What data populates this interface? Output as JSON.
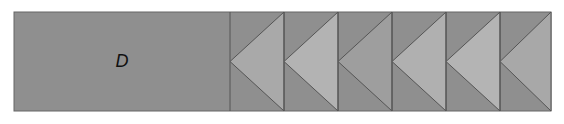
{
  "diagram": {
    "label": "D",
    "colors": {
      "background": "#ffffff",
      "block_fill": "#8f8f8f",
      "triangle_fills": [
        "#a9a9a9",
        "#b3b3b3",
        "#9e9e9e",
        "#b0b0b0",
        "#b4b4b4",
        "#a8a8a8"
      ],
      "outline": "#555555"
    },
    "sections": [
      {
        "name": "label-block",
        "x0": 14,
        "x1": 230
      },
      {
        "name": "triangle-1",
        "x0": 230,
        "x1": 284
      },
      {
        "name": "triangle-2",
        "x0": 284,
        "x1": 338
      },
      {
        "name": "triangle-3",
        "x0": 338,
        "x1": 392
      },
      {
        "name": "triangle-4",
        "x0": 392,
        "x1": 446
      },
      {
        "name": "triangle-5",
        "x0": 446,
        "x1": 500
      },
      {
        "name": "triangle-6",
        "x0": 500,
        "x1": 551
      }
    ]
  }
}
